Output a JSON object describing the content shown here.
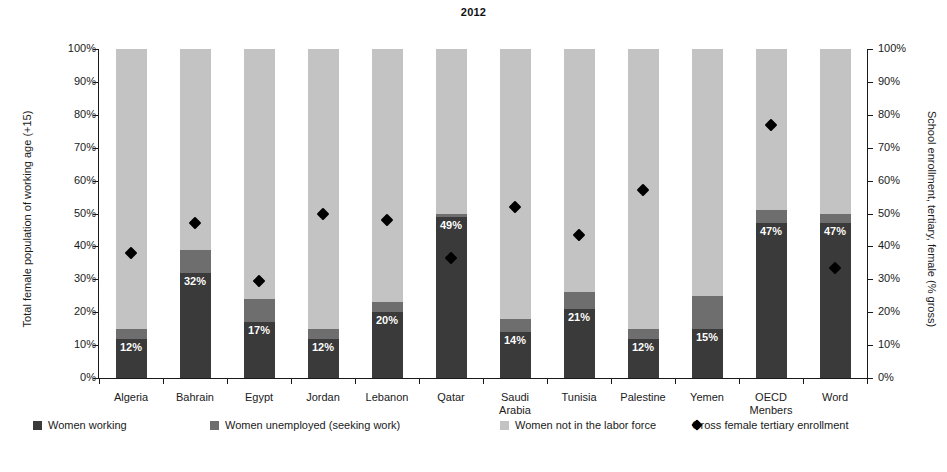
{
  "chart_data": {
    "type": "bar",
    "title": "2012",
    "subtitle": "",
    "xlabel": "",
    "ylabel": "Total female population of working age (+15)",
    "y2label": "School enrollment, tertiary, female (% gross)",
    "ylim": [
      0,
      100
    ],
    "y2lim": [
      0,
      100
    ],
    "grid": false,
    "legend_position": "bottom",
    "stacked": true,
    "ytick_labels": [
      "0%",
      "10%",
      "20%",
      "30%",
      "40%",
      "50%",
      "60%",
      "70%",
      "80%",
      "90%",
      "100%"
    ],
    "ytick_values": [
      0,
      10,
      20,
      30,
      40,
      50,
      60,
      70,
      80,
      90,
      100
    ],
    "y2tick_labels": [
      "0%",
      "10%",
      "20%",
      "30%",
      "40%",
      "50%",
      "60%",
      "70%",
      "80%",
      "90%",
      "100%"
    ],
    "y2tick_values": [
      0,
      10,
      20,
      30,
      40,
      50,
      60,
      70,
      80,
      90,
      100
    ],
    "categories": [
      "Algeria",
      "Bahrain",
      "Egypt",
      "Jordan",
      "Lebanon",
      "Qatar",
      "Saudi Arabia",
      "Tunisia",
      "Palestine",
      "Yemen",
      "OECD Menbers",
      "Word"
    ],
    "category_lines": [
      [
        "Algeria"
      ],
      [
        "Bahrain"
      ],
      [
        "Egypt"
      ],
      [
        "Jordan"
      ],
      [
        "Lebanon"
      ],
      [
        "Qatar"
      ],
      [
        "Saudi",
        "Arabia"
      ],
      [
        "Tunisia"
      ],
      [
        "Palestine"
      ],
      [
        "Yemen"
      ],
      [
        "OECD",
        "Menbers"
      ],
      [
        "Word"
      ]
    ],
    "series": [
      {
        "name": "Women working",
        "color": "#3a3a3a",
        "values": [
          12,
          32,
          17,
          12,
          20,
          49,
          14,
          21,
          12,
          15,
          47,
          47
        ],
        "data_labels": [
          "12%",
          "32%",
          "17%",
          "12%",
          "20%",
          "49%",
          "14%",
          "21%",
          "12%",
          "15%",
          "47%",
          "47%"
        ]
      },
      {
        "name": "Women unemployed (seeking work)",
        "color": "#6e6e6e",
        "values": [
          3,
          7,
          7,
          3,
          3,
          1,
          4,
          5,
          3,
          10,
          4,
          3
        ],
        "data_labels": [
          "",
          "",
          "",
          "",
          "",
          "",
          "",
          "",
          "",
          "",
          "",
          ""
        ]
      },
      {
        "name": "Women not in the labor force",
        "color": "#c3c3c3",
        "values": [
          85,
          61,
          76,
          85,
          77,
          50,
          82,
          74,
          85,
          75,
          49,
          50
        ],
        "data_labels": [
          "",
          "",
          "",
          "",
          "",
          "",
          "",
          "",
          "",
          "",
          "",
          ""
        ]
      }
    ],
    "marker_series": {
      "name": "Gross female tertiary enrollment",
      "color": "#000000",
      "marker": "diamond",
      "axis": "right",
      "values": [
        38,
        47,
        29.5,
        50,
        48,
        36.5,
        52,
        43.5,
        57,
        null,
        77,
        33.5
      ]
    },
    "legend": [
      {
        "label": "Women working",
        "swatch": "dark-square"
      },
      {
        "label": "Women unemployed (seeking work)",
        "swatch": "mid-square"
      },
      {
        "label": "Women not in the labor force",
        "swatch": "light-square"
      },
      {
        "label": "Gross female tertiary enrollment",
        "swatch": "black-diamond"
      }
    ]
  }
}
